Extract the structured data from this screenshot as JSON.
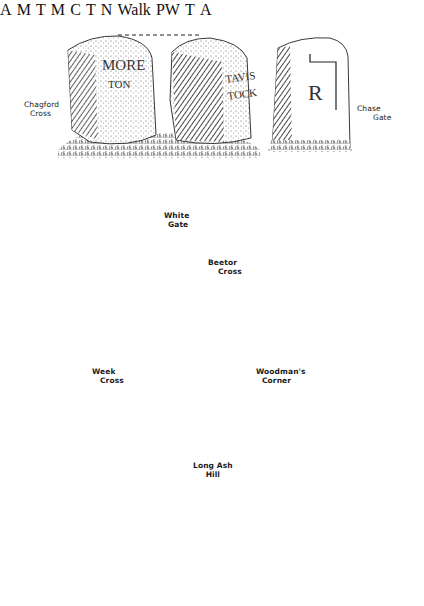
{
  "illustration": {
    "style": "pen-and-ink drawing",
    "ink_color": "#1a1a1a",
    "paper_color": "#ffffff",
    "groups": [
      {
        "id": "chagford-chase",
        "captions": [
          {
            "line1": "Chagford",
            "line2": "Cross"
          },
          {
            "line1": "Chase",
            "line2": "Gate"
          }
        ],
        "stones": [
          {
            "name": "Chagford Cross stone",
            "inscription_lines": [
              "M",
              "ORE",
              "TON",
              "S"
            ]
          },
          {
            "name": "Tavistock face stone",
            "inscription_lines": [
              "TAVIS",
              "TOCK"
            ]
          },
          {
            "name": "Chase Gate stone",
            "inscription_lines": [
              "R"
            ]
          }
        ]
      },
      {
        "id": "white-gate-beetor",
        "captions": [
          {
            "line1": "White",
            "line2": "Gate"
          },
          {
            "line1": "Beetor",
            "line2": "Cross"
          }
        ],
        "stones": [
          {
            "name": "White Gate left face",
            "inscription_lines": [
              "A"
            ]
          },
          {
            "name": "White Gate right face",
            "inscription_lines": [
              "M"
            ]
          },
          {
            "name": "Beetor Cross left face",
            "inscription_lines": [
              "T"
            ]
          },
          {
            "name": "Beetor Cross right face",
            "inscription_lines": [
              "M",
              "C"
            ]
          }
        ]
      },
      {
        "id": "week-woodman-longash",
        "captions": [
          {
            "line1": "Week",
            "line2": "Cross"
          },
          {
            "line1": "Woodman's",
            "line2": "Corner"
          },
          {
            "line1": "Long Ash",
            "line2": "Hill"
          }
        ],
        "stones": [
          {
            "name": "Week Cross stone",
            "inscription_lines": [
              "T",
              "N"
            ]
          },
          {
            "name": "Woodman's Corner stone",
            "inscription_lines": [
              "Walk",
              "PW"
            ]
          },
          {
            "name": "Long Ash Hill left face",
            "inscription_lines": [
              "T"
            ]
          },
          {
            "name": "Long Ash Hill right face",
            "inscription_lines": [
              "A"
            ]
          }
        ]
      }
    ]
  },
  "labels": {
    "chagford_1": "Chagford",
    "chagford_2": "Cross",
    "chase_1": "Chase",
    "chase_2": "Gate",
    "white_1": "White",
    "white_2": "Gate",
    "beetor_1": "Beetor",
    "beetor_2": "Cross",
    "week_1": "Week",
    "week_2": "Cross",
    "woodman_1": "Woodman's",
    "woodman_2": "Corner",
    "longash_1": "Long Ash",
    "longash_2": "Hill"
  },
  "inscriptions": {
    "more": "MORE",
    "ton": "TON",
    "tavis": "TAVIS",
    "tock": "TOCK",
    "r": "R",
    "a1": "A",
    "m1": "M",
    "t1": "T",
    "c1": "C",
    "m2": "M",
    "n1": "N",
    "t2": "T",
    "a2": "A",
    "walk": "Walk",
    "pw": "PW"
  }
}
